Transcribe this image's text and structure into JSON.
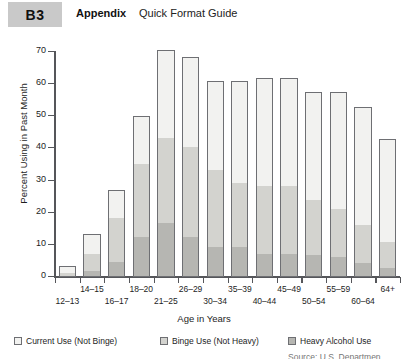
{
  "header": {
    "badge": "B3",
    "appendix": "Appendix",
    "subtitle": "Quick Format Guide"
  },
  "legend": {
    "items": [
      {
        "label": "Current Use (Not Binge)",
        "color": "#f2f2f0"
      },
      {
        "label": "Binge Use (Not Heavy)",
        "color": "#d3d3cf"
      },
      {
        "label": "Heavy Alcohol Use",
        "color": "#b6b6b2"
      }
    ]
  },
  "source_note": "Source: U.S. Departmen",
  "chart_data": {
    "type": "bar",
    "stacked": true,
    "title": "",
    "xlabel": "Age in Years",
    "ylabel": "Percent Using in Past Month",
    "ylim": [
      0,
      70
    ],
    "yticks": [
      0,
      10,
      20,
      30,
      40,
      50,
      60,
      70
    ],
    "grid": false,
    "legend_position": "bottom",
    "categories": [
      "12–13",
      "14–15",
      "16–17",
      "18–20",
      "21–25",
      "26–29",
      "30–34",
      "35–39",
      "40–44",
      "45–49",
      "50–54",
      "55–59",
      "60–64",
      "64+"
    ],
    "series": [
      {
        "name": "Heavy Alcohol Use",
        "color": "#b6b6b2",
        "values": [
          0,
          1.5,
          4.5,
          12,
          16.5,
          12,
          9,
          9,
          7,
          7,
          6.5,
          6,
          4,
          2.5
        ]
      },
      {
        "name": "Binge Use (Not Heavy)",
        "color": "#d3d3cf",
        "values": [
          1,
          5.5,
          13.5,
          23,
          26.5,
          28,
          24,
          20,
          21,
          21,
          17,
          15,
          12,
          8
        ]
      },
      {
        "name": "Current Use (Not Binge)",
        "color": "#f2f2f0",
        "values": [
          2.5,
          6.5,
          9,
          15,
          27.5,
          28.5,
          28,
          32,
          34,
          34,
          34,
          36.5,
          37,
          32.5
        ]
      }
    ],
    "totals": [
      3.5,
      13.5,
      27,
      50,
      70.5,
      68.5,
      61,
      61,
      62,
      62,
      57.5,
      57.5,
      53,
      43
    ]
  }
}
